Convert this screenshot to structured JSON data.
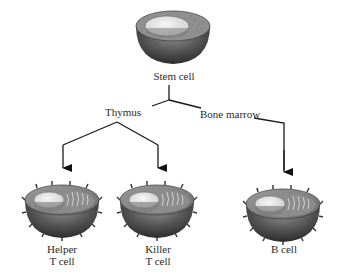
{
  "diagram": {
    "nodes": [
      {
        "id": "stem",
        "label": "Stem cell"
      },
      {
        "id": "thymus",
        "label": "Thymus"
      },
      {
        "id": "bone_marrow",
        "label": "Bone marrow"
      },
      {
        "id": "helper",
        "label_line1": "Helper",
        "label_line2": "T cell"
      },
      {
        "id": "killer",
        "label_line1": "Killer",
        "label_line2": "T cell"
      },
      {
        "id": "bcell",
        "label": "B cell"
      }
    ],
    "edges": [
      {
        "from": "stem",
        "to": "thymus"
      },
      {
        "from": "stem",
        "to": "bone_marrow"
      },
      {
        "from": "thymus",
        "to": "helper"
      },
      {
        "from": "thymus",
        "to": "killer"
      },
      {
        "from": "bone_marrow",
        "to": "bcell"
      }
    ],
    "colors": {
      "line": "#1a1a1a",
      "cell_shell": "#5a5a5a",
      "nucleus": "#e8e8e8"
    }
  }
}
